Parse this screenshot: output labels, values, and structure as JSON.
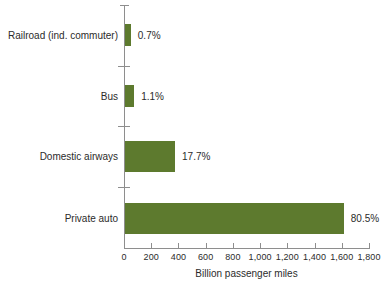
{
  "chart_data": {
    "type": "bar",
    "orientation": "horizontal",
    "title": "",
    "xlabel": "Billion passenger miles",
    "ylabel": "",
    "xlim": [
      0,
      1800
    ],
    "xticks": [
      0,
      200,
      400,
      600,
      800,
      1000,
      1200,
      1400,
      1600,
      1800
    ],
    "xtick_labels": [
      "0",
      "200",
      "400",
      "600",
      "800",
      "1,000",
      "1,200",
      "1,400",
      "1,600",
      "1,800"
    ],
    "grid": false,
    "legend": "none",
    "bar_color": "#5d7a2e",
    "axis_color": "#8e8e8e",
    "text_color": "#2b2b2b",
    "categories": [
      "Railroad (ind. commuter)",
      "Bus",
      "Domestic airways",
      "Private auto"
    ],
    "values": [
      50,
      75,
      375,
      1615
    ],
    "data_labels": [
      "0.7%",
      "1.1%",
      "17.7%",
      "80.5%"
    ],
    "bars": [
      {
        "category": "Railroad (ind. commuter)",
        "value": 50,
        "data_label": "0.7%"
      },
      {
        "category": "Bus",
        "value": 75,
        "data_label": "1.1%"
      },
      {
        "category": "Domestic airways",
        "value": 375,
        "data_label": "17.7%"
      },
      {
        "category": "Private auto",
        "value": 1615,
        "data_label": "80.5%"
      }
    ]
  }
}
